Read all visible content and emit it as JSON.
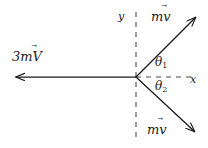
{
  "figure": {
    "background_color": "#ffffff",
    "stroke_color": "#1a1a1a",
    "origin": {
      "x": 136,
      "y": 77
    },
    "axes": {
      "x_label": "x",
      "y_label": "y",
      "style": "dashed",
      "x_axis": {
        "x1": 136,
        "y1": 77,
        "x2": 192,
        "y2": 77
      },
      "y_axis": {
        "x1": 136,
        "y1": 12,
        "x2": 136,
        "y2": 141
      }
    },
    "vectors": [
      {
        "name": "incoming-momentum-left",
        "label": "3mV",
        "label_prefix": "3m",
        "label_symbol": "V",
        "has_vector_arrow": true,
        "from": {
          "x": 136,
          "y": 77
        },
        "to": {
          "x": 14,
          "y": 77
        },
        "direction_degrees": 180
      },
      {
        "name": "outgoing-momentum-upper",
        "label": "mv",
        "label_prefix": "m",
        "label_symbol": "v",
        "has_vector_arrow": true,
        "from": {
          "x": 136,
          "y": 77
        },
        "to": {
          "x": 197,
          "y": 16
        },
        "direction_degrees": 45
      },
      {
        "name": "outgoing-momentum-lower",
        "label": "mv",
        "label_prefix": "m",
        "label_symbol": "v",
        "has_vector_arrow": true,
        "from": {
          "x": 136,
          "y": 77
        },
        "to": {
          "x": 196,
          "y": 133
        },
        "direction_degrees": -43
      }
    ],
    "angles": [
      {
        "name": "theta-1",
        "symbol": "θ",
        "subscript": "1",
        "between": "x-axis and upper momentum vector"
      },
      {
        "name": "theta-2",
        "symbol": "θ",
        "subscript": "2",
        "between": "x-axis and lower momentum vector"
      }
    ],
    "vector_arrow_glyph": "⃗"
  }
}
